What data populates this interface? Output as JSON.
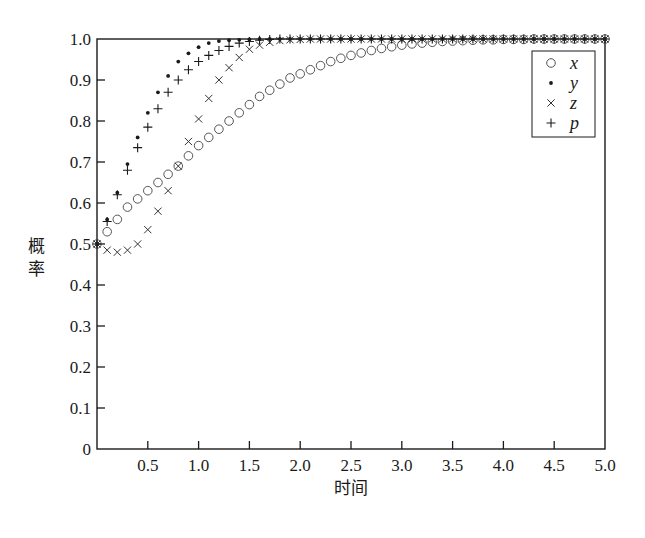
{
  "chart_data": {
    "type": "scatter",
    "title": "",
    "xlabel": "时间",
    "ylabel": "概率",
    "xlim": [
      0,
      5.0
    ],
    "ylim": [
      0,
      1.0
    ],
    "grid": false,
    "legend_position": "upper right",
    "x_ticks": [
      "0.5",
      "1.0",
      "1.5",
      "2.0",
      "2.5",
      "3.0",
      "3.5",
      "4.0",
      "4.5",
      "5.0"
    ],
    "x_tick_values": [
      0.5,
      1.0,
      1.5,
      2.0,
      2.5,
      3.0,
      3.5,
      4.0,
      4.5,
      5.0
    ],
    "y_ticks": [
      "0",
      "0.1",
      "0.2",
      "0.3",
      "0.4",
      "0.5",
      "0.6",
      "0.7",
      "0.8",
      "0.9",
      "1.0"
    ],
    "y_tick_values": [
      0,
      0.1,
      0.2,
      0.3,
      0.4,
      0.5,
      0.6,
      0.7,
      0.8,
      0.9,
      1.0
    ],
    "x": [
      0.0,
      0.1,
      0.2,
      0.3,
      0.4,
      0.5,
      0.6,
      0.7,
      0.8,
      0.9,
      1.0,
      1.1,
      1.2,
      1.3,
      1.4,
      1.5,
      1.6,
      1.7,
      1.8,
      1.9,
      2.0,
      2.1,
      2.2,
      2.3,
      2.4,
      2.5,
      2.6,
      2.7,
      2.8,
      2.9,
      3.0,
      3.1,
      3.2,
      3.3,
      3.4,
      3.5,
      3.6,
      3.7,
      3.8,
      3.9,
      4.0,
      4.1,
      4.2,
      4.3,
      4.4,
      4.5,
      4.6,
      4.7,
      4.8,
      4.9,
      5.0
    ],
    "series": [
      {
        "name": "x",
        "marker": "circle",
        "values": [
          0.5,
          0.53,
          0.56,
          0.59,
          0.61,
          0.63,
          0.65,
          0.67,
          0.69,
          0.715,
          0.74,
          0.76,
          0.78,
          0.8,
          0.82,
          0.84,
          0.86,
          0.875,
          0.89,
          0.905,
          0.915,
          0.925,
          0.935,
          0.945,
          0.953,
          0.96,
          0.966,
          0.972,
          0.977,
          0.981,
          0.985,
          0.988,
          0.99,
          0.992,
          0.994,
          0.995,
          0.996,
          0.997,
          0.998,
          0.998,
          0.999,
          0.999,
          0.999,
          1.0,
          1.0,
          1.0,
          1.0,
          1.0,
          1.0,
          1.0,
          1.0
        ]
      },
      {
        "name": "y",
        "marker": "dot",
        "values": [
          0.5,
          0.56,
          0.625,
          0.695,
          0.76,
          0.82,
          0.87,
          0.91,
          0.945,
          0.965,
          0.98,
          0.99,
          0.995,
          0.997,
          0.998,
          0.999,
          1.0,
          1.0,
          1.0,
          1.0,
          1.0,
          1.0,
          1.0,
          1.0,
          1.0,
          1.0,
          1.0,
          1.0,
          1.0,
          1.0,
          1.0,
          1.0,
          1.0,
          1.0,
          1.0,
          1.0,
          1.0,
          1.0,
          1.0,
          1.0,
          1.0,
          1.0,
          1.0,
          1.0,
          1.0,
          1.0,
          1.0,
          1.0,
          1.0,
          1.0,
          1.0
        ]
      },
      {
        "name": "z",
        "marker": "x",
        "values": [
          0.5,
          0.485,
          0.48,
          0.485,
          0.5,
          0.535,
          0.58,
          0.63,
          0.69,
          0.75,
          0.805,
          0.855,
          0.9,
          0.93,
          0.955,
          0.975,
          0.985,
          0.992,
          0.996,
          0.998,
          0.999,
          1.0,
          1.0,
          1.0,
          1.0,
          1.0,
          1.0,
          1.0,
          1.0,
          1.0,
          1.0,
          1.0,
          1.0,
          1.0,
          1.0,
          1.0,
          1.0,
          1.0,
          1.0,
          1.0,
          1.0,
          1.0,
          1.0,
          1.0,
          1.0,
          1.0,
          1.0,
          1.0,
          1.0,
          1.0,
          1.0
        ]
      },
      {
        "name": "p",
        "marker": "plus",
        "values": [
          0.5,
          0.555,
          0.62,
          0.68,
          0.735,
          0.785,
          0.83,
          0.87,
          0.9,
          0.925,
          0.945,
          0.96,
          0.972,
          0.982,
          0.99,
          0.994,
          0.997,
          0.999,
          1.0,
          1.0,
          1.0,
          1.0,
          1.0,
          1.0,
          1.0,
          1.0,
          1.0,
          1.0,
          1.0,
          1.0,
          1.0,
          1.0,
          1.0,
          1.0,
          1.0,
          1.0,
          1.0,
          1.0,
          1.0,
          1.0,
          1.0,
          1.0,
          1.0,
          1.0,
          1.0,
          1.0,
          1.0,
          1.0,
          1.0,
          1.0,
          1.0
        ]
      }
    ],
    "legend": [
      {
        "symbol": "○",
        "label": "x"
      },
      {
        "symbol": "•",
        "label": "y"
      },
      {
        "symbol": "×",
        "label": "z"
      },
      {
        "symbol": "+",
        "label": "p"
      }
    ],
    "colors": {
      "ink": "#1a1a1a",
      "circle": "#555555",
      "background": "#ffffff"
    }
  }
}
